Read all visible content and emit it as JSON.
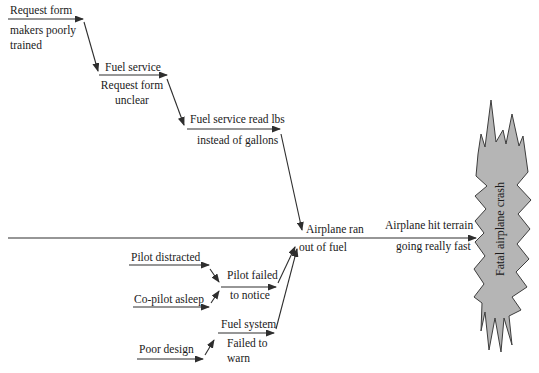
{
  "colors": {
    "background": "#ffffff",
    "line": "#2e2e2e",
    "text": "#1a1a1a",
    "starburst_fill": "#b5b5b5",
    "starburst_stroke": "#3d3d3d"
  },
  "diagram": {
    "upper_chain": [
      {
        "above": "Request form",
        "below": "makers poorly trained"
      },
      {
        "above": "Fuel service",
        "below": "Request form unclear"
      },
      {
        "above": "Fuel service read lbs",
        "below": "instead of gallons"
      }
    ],
    "spine_events": [
      {
        "above": "Airplane ran",
        "below": "out of fuel"
      },
      {
        "above": "Airplane hit terrain",
        "below": "going really fast"
      }
    ],
    "lower_branches": {
      "pilot_distracted": "Pilot distracted",
      "pilot_failed_above": "Pilot failed",
      "pilot_failed_below": "to notice",
      "copilot_asleep": "Co-pilot asleep",
      "fuel_system_above": "Fuel system",
      "fuel_system_below": "Failed to warn",
      "poor_design": "Poor design"
    },
    "outcome": "Fatal airplane crash"
  }
}
